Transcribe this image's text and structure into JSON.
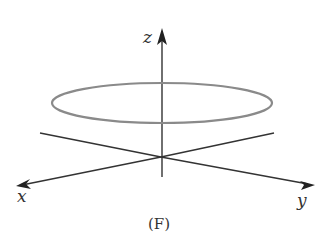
{
  "figure": {
    "caption": "(F)",
    "axes": {
      "x_label": "x",
      "y_label": "y",
      "z_label": "z"
    },
    "colors": {
      "axis": "#333333",
      "curve": "#8a8a8a",
      "background": "#ffffff"
    },
    "curve": {
      "type": "horizontal circle (ellipse in perspective) above xy-plane",
      "center": [
        162,
        103
      ],
      "rx": 110,
      "ry": 20
    }
  }
}
